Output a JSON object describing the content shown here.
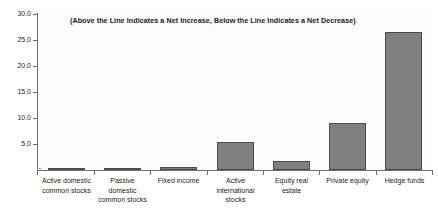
{
  "chart_data": {
    "type": "bar",
    "title": "(Above the Line Indicates a Net Increase, Below the Line Indicates a Net Decrease)",
    "xlabel": "",
    "ylabel": "",
    "ylim": [
      0,
      30
    ],
    "grid": false,
    "legend": "none",
    "orientation": "vertical",
    "bar_color": "#808080",
    "bar_edge_color": "#4d4d4d",
    "categories": [
      "Active domestic common stocks",
      "Passive domestic common stocks",
      "Fixed income",
      "Active international stocks",
      "Equity real estate",
      "Private equity",
      "Hedge funds"
    ],
    "values": [
      0.2,
      0.2,
      0.5,
      5.3,
      1.8,
      9.0,
      26.5
    ],
    "ytick_labels": [
      "30.0",
      "25.0",
      "20.0",
      "15.0",
      "10.0",
      "5.0",
      "-"
    ],
    "ytick_values": [
      30.0,
      25.0,
      20.0,
      15.0,
      10.0,
      5.0,
      0.0
    ]
  },
  "axis": {
    "y": {
      "t0": "30.0",
      "t1": "25.0",
      "t2": "20.0",
      "t3": "15.0",
      "t4": "10.0",
      "t5": "5.0",
      "t6": "-"
    }
  },
  "categories_display": {
    "c0_l1": "Active domestic",
    "c0_l2": "common stocks",
    "c1_l1": "Passive",
    "c1_l2": "domestic",
    "c1_l3": "common stocks",
    "c2_l1": "Fixed income",
    "c3_l1": "Active",
    "c3_l2": "international",
    "c3_l3": "stocks",
    "c4_l1": "Equity real",
    "c4_l2": "estate",
    "c5_l1": "Private equity",
    "c6_l1": "Hedge funds"
  }
}
